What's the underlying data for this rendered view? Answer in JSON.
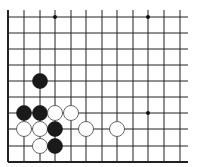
{
  "board": {
    "title": "Go board diagram (lower-left corner)",
    "background": "#ffffff",
    "line_color": "#222222",
    "columns_x": [
      8,
      24,
      40,
      55,
      71,
      86,
      102,
      117,
      133,
      148,
      164,
      180
    ],
    "rows_y": [
      17,
      33,
      49,
      65,
      81,
      97,
      113,
      129,
      146,
      162
    ],
    "right_extent": 188,
    "top_extent": 10,
    "left_edge": true,
    "bottom_edge": true,
    "star_points": [
      {
        "col": 3,
        "row": 0
      },
      {
        "col": 9,
        "row": 0
      },
      {
        "col": 9,
        "row": 6
      }
    ],
    "stones": [
      {
        "color": "black",
        "col": 2,
        "row": 4
      },
      {
        "color": "black",
        "col": 1,
        "row": 6
      },
      {
        "color": "black",
        "col": 2,
        "row": 6
      },
      {
        "color": "white",
        "col": 3,
        "row": 6
      },
      {
        "color": "white",
        "col": 4,
        "row": 6
      },
      {
        "color": "white",
        "col": 1,
        "row": 7
      },
      {
        "color": "white",
        "col": 2,
        "row": 7
      },
      {
        "color": "black",
        "col": 3,
        "row": 7
      },
      {
        "color": "white",
        "col": 5,
        "row": 7
      },
      {
        "color": "white",
        "col": 7,
        "row": 7
      },
      {
        "color": "white",
        "col": 2,
        "row": 8
      },
      {
        "color": "black",
        "col": 3,
        "row": 8
      }
    ],
    "stone_radius": 7.5
  }
}
